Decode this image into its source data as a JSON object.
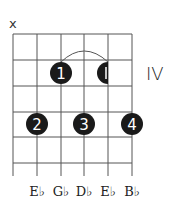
{
  "diagram": {
    "type": "guitar-chord-diagram",
    "position_label": "IV",
    "muted_marker": "x",
    "string_labels": [
      "E♭",
      "G♭",
      "D♭",
      "E♭",
      "B♭"
    ],
    "fingers": [
      {
        "label": "1",
        "string": 3,
        "fret": 2
      },
      {
        "label": "1",
        "string": 5,
        "fret": 2,
        "partial": true
      },
      {
        "label": "2",
        "string": 2,
        "fret": 4
      },
      {
        "label": "3",
        "string": 4,
        "fret": 4
      },
      {
        "label": "4",
        "string": 6,
        "fret": 4
      }
    ],
    "barre": {
      "from_string": 3,
      "to_string": 5,
      "fret": 2
    },
    "colors": {
      "dot": "#1a1a1a",
      "grid": "#555555",
      "text": "#222222"
    }
  }
}
